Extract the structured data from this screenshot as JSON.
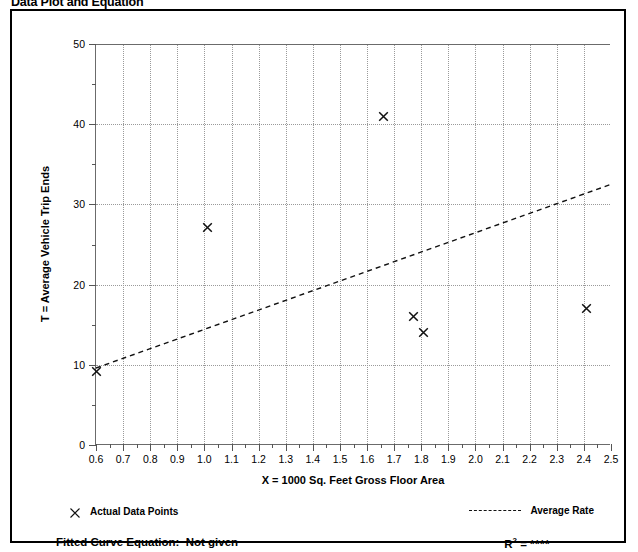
{
  "page": {
    "title": "Data Plot and Equation"
  },
  "chart_data": {
    "type": "scatter",
    "title": "Data Plot and Equation",
    "xlabel": "X = 1000 Sq. Feet Gross Floor Area",
    "ylabel": "T = Average Vehicle Trip Ends",
    "xlim": [
      0.6,
      2.5
    ],
    "ylim": [
      0,
      50
    ],
    "xticks": [
      0.6,
      0.7,
      0.8,
      0.9,
      1.0,
      1.1,
      1.2,
      1.3,
      1.4,
      1.5,
      1.6,
      1.7,
      1.8,
      1.9,
      2.0,
      2.1,
      2.2,
      2.3,
      2.4,
      2.5
    ],
    "xtick_labels": [
      "0.6",
      "0.7",
      "0.8",
      "0.9",
      "1.0",
      "1.1",
      "1.2",
      "1.3",
      "1.4",
      "1.5",
      "1.6",
      "1.7",
      "1.8",
      "1.9",
      "2.0",
      "2.1",
      "2.2",
      "2.3",
      "2.4",
      "2.5"
    ],
    "yticks": [
      0,
      10,
      20,
      30,
      40,
      50
    ],
    "ytick_labels": [
      "0",
      "10",
      "20",
      "30",
      "40",
      "50"
    ],
    "ytick_minor": [
      5,
      15,
      25,
      35,
      45
    ],
    "grid": true,
    "grid_style": "dotted",
    "series": [
      {
        "name": "Actual Data Points",
        "type": "scatter",
        "marker": "x",
        "color": "#111111",
        "points": [
          {
            "x": 0.6,
            "y": 9.2
          },
          {
            "x": 1.01,
            "y": 27.1
          },
          {
            "x": 1.66,
            "y": 41.0
          },
          {
            "x": 1.77,
            "y": 16.0
          },
          {
            "x": 1.81,
            "y": 14.0
          },
          {
            "x": 2.41,
            "y": 17.0
          }
        ]
      },
      {
        "name": "Average Rate",
        "type": "line",
        "style": "dashed",
        "color": "#111111",
        "endpoints": [
          {
            "x": 0.6,
            "y": 9.6
          },
          {
            "x": 2.5,
            "y": 32.5
          }
        ]
      }
    ],
    "legend": [
      {
        "label": "Actual Data Points",
        "marker": "x",
        "position": "bottom-left"
      },
      {
        "label": "Average Rate",
        "marker": "dashed-line",
        "position": "bottom-right"
      }
    ],
    "annotations": {
      "fitted_curve_label": "Fitted Curve Equation:",
      "fitted_curve_value": "Not given",
      "r2_label": "R",
      "r2_exponent": "2",
      "r2_equals": "=",
      "r2_value": "****"
    }
  }
}
